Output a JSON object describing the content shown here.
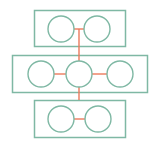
{
  "diagram": {
    "title": "",
    "colors": {
      "shape_stroke": "#7fb8a4",
      "connector": "#ec7a5c",
      "background": "#ffffff"
    },
    "groups": [
      {
        "id": "top",
        "x": 34,
        "y": 10,
        "w": 91,
        "h": 36
      },
      {
        "id": "middle",
        "x": 12,
        "y": 55,
        "w": 135,
        "h": 37
      },
      {
        "id": "bottom",
        "x": 34,
        "y": 100,
        "w": 91,
        "h": 37
      }
    ],
    "nodes": [
      {
        "id": "t1",
        "group": "top",
        "cx": 61,
        "cy": 29,
        "r": 13
      },
      {
        "id": "t2",
        "group": "top",
        "cx": 97,
        "cy": 29,
        "r": 13
      },
      {
        "id": "m1",
        "group": "middle",
        "cx": 41,
        "cy": 74,
        "r": 13
      },
      {
        "id": "m2",
        "group": "middle",
        "cx": 79,
        "cy": 74,
        "r": 13
      },
      {
        "id": "m3",
        "group": "middle",
        "cx": 120,
        "cy": 74,
        "r": 13
      },
      {
        "id": "b1",
        "group": "bottom",
        "cx": 61,
        "cy": 119,
        "r": 13
      },
      {
        "id": "b2",
        "group": "bottom",
        "cx": 98,
        "cy": 119,
        "r": 13
      }
    ],
    "edges": [
      {
        "id": "t1-t2",
        "x1": 74,
        "y1": 29,
        "x2": 84,
        "y2": 29
      },
      {
        "id": "t-m2",
        "x1": 79,
        "y1": 29,
        "x2": 79,
        "y2": 61
      },
      {
        "id": "m1-m2",
        "x1": 54,
        "y1": 74,
        "x2": 66,
        "y2": 74
      },
      {
        "id": "m2-m3",
        "x1": 92,
        "y1": 74,
        "x2": 107,
        "y2": 74
      },
      {
        "id": "m2-b",
        "x1": 79,
        "y1": 87,
        "x2": 79,
        "y2": 100
      },
      {
        "id": "b1-b2",
        "x1": 74,
        "y1": 119,
        "x2": 85,
        "y2": 119
      }
    ]
  }
}
